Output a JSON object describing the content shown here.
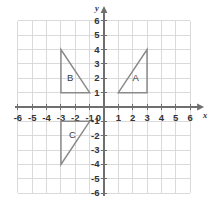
{
  "chart_data": {
    "type": "scatter",
    "title": "",
    "xlabel": "x",
    "ylabel": "y",
    "xlim": [
      -6,
      6
    ],
    "ylim": [
      -6,
      6
    ],
    "grid": true,
    "legend": "none",
    "x_ticks": [
      -6,
      -5,
      -4,
      -3,
      -2,
      -1,
      1,
      2,
      3,
      4,
      5,
      6
    ],
    "y_ticks": [
      6,
      5,
      4,
      3,
      2,
      1,
      -1,
      -2,
      -3,
      -4,
      -5,
      -6
    ],
    "x_tick_labels": [
      "-6",
      "-5",
      "-4",
      "-3",
      "-2",
      "-1",
      "1",
      "2",
      "3",
      "4",
      "5",
      "6"
    ],
    "y_tick_labels": [
      "6",
      "5",
      "4",
      "3",
      "2",
      "1",
      "-1",
      "-2",
      "-3",
      "-4",
      "-5",
      "-6"
    ],
    "origin_label": "0",
    "x_axis_label": "x",
    "y_axis_label": "y",
    "shapes": [
      {
        "name": "A",
        "label": "A",
        "vertices": [
          [
            1,
            1
          ],
          [
            3,
            1
          ],
          [
            3,
            4
          ]
        ],
        "label_position": [
          2.2,
          2.0
        ],
        "stroke": "#8a8a8a"
      },
      {
        "name": "B",
        "label": "B",
        "vertices": [
          [
            -3,
            4
          ],
          [
            -3,
            1
          ],
          [
            -1,
            1
          ]
        ],
        "label_position": [
          -2.35,
          2.0
        ],
        "stroke": "#8a8a8a"
      },
      {
        "name": "C",
        "label": "C",
        "vertices": [
          [
            -3,
            -1
          ],
          [
            -1,
            -1
          ],
          [
            -3,
            -4
          ]
        ],
        "label_position": [
          -2.2,
          -2.0
        ],
        "stroke": "#8a8a8a"
      }
    ]
  },
  "colors": {
    "background": "#ffffff",
    "grid": "#d6d6d6",
    "axis": "#6f6f6f",
    "shape_stroke": "#8a8a8a",
    "label_text": "#333333"
  }
}
